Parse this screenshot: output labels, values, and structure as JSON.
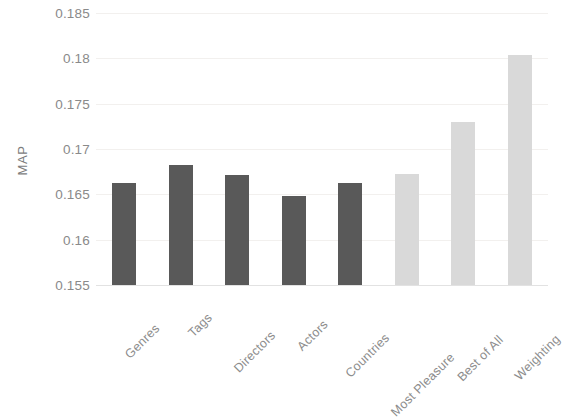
{
  "chart_data": {
    "type": "bar",
    "title": "",
    "subtitle": "",
    "xlabel": "",
    "ylabel": "MAP",
    "categories": [
      "Genres",
      "Tags",
      "Directors",
      "Actors",
      "Countries",
      "Most Pleasure",
      "Best of All",
      "Weighting"
    ],
    "values": [
      0.1663,
      0.1682,
      0.1671,
      0.1648,
      0.1663,
      0.1672,
      0.173,
      0.1804
    ],
    "bar_colors": [
      "#595959",
      "#595959",
      "#595959",
      "#595959",
      "#595959",
      "#d9d9d9",
      "#d9d9d9",
      "#d9d9d9"
    ],
    "series": [
      {
        "name": "MAP",
        "values": [
          0.1663,
          0.1682,
          0.1671,
          0.1648,
          0.1663,
          0.1672,
          0.173,
          0.1804
        ]
      }
    ],
    "ylim": [
      0.155,
      0.185
    ],
    "yticks": [
      0.155,
      0.16,
      0.165,
      0.17,
      0.175,
      0.18,
      0.185
    ],
    "ytick_labels": [
      "0.155",
      "0.16",
      "0.165",
      "0.17",
      "0.175",
      "0.18",
      "0.185"
    ],
    "grid": true,
    "grid_axis": "y",
    "legend": false,
    "legend_position": "none",
    "colors": {
      "bar_dark": "#595959",
      "bar_light": "#d9d9d9",
      "gridline": "#f2f0ee",
      "axis": "#e2e2e2",
      "tick_text": "#8a8a8a",
      "background": "#ffffff"
    }
  }
}
